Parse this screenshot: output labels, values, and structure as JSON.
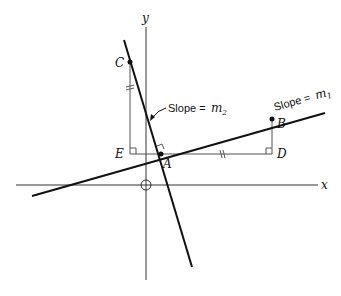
{
  "diagram": {
    "type": "geometry",
    "axes": {
      "x_label": "x",
      "y_label": "y"
    },
    "lines": [
      {
        "id": "line-1",
        "label_prefix": "Slope = ",
        "slope_symbol": "m",
        "slope_subscript": "1"
      },
      {
        "id": "line-2",
        "label_prefix": "Slope = ",
        "slope_symbol": "m",
        "slope_subscript": "2"
      }
    ],
    "points": {
      "A": "A",
      "B": "B",
      "C": "C",
      "D": "D",
      "E": "E"
    },
    "colors": {
      "line": "#111111",
      "axis": "#333333",
      "construction": "#555555"
    }
  }
}
